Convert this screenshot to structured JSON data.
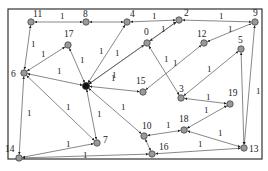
{
  "diagram": {
    "type": "directed weighted graph",
    "frame": {
      "x": 8,
      "y": 9,
      "w": 254,
      "h": 150,
      "stroke": "#333333"
    },
    "colors": {
      "node_fill": "#9a9a9a",
      "node_stroke": "#444444",
      "hub_fill": "#111111",
      "edge": "#555555"
    },
    "nodes": [
      {
        "id": "0",
        "label": "0",
        "x": 147,
        "y": 43,
        "lx": 144,
        "ly": 35
      },
      {
        "id": "1",
        "label": "",
        "x": 86,
        "y": 86,
        "hub": true
      },
      {
        "id": "2",
        "label": "2",
        "x": 179,
        "y": 20,
        "lx": 184,
        "ly": 16
      },
      {
        "id": "3",
        "label": "3",
        "x": 181,
        "y": 98,
        "lx": 179,
        "ly": 92
      },
      {
        "id": "4",
        "label": "4",
        "x": 127,
        "y": 22,
        "lx": 130,
        "ly": 17
      },
      {
        "id": "5",
        "label": "5",
        "x": 241,
        "y": 49,
        "lx": 238,
        "ly": 43
      },
      {
        "id": "6",
        "label": "6",
        "x": 24,
        "y": 73,
        "lx": 11,
        "ly": 77
      },
      {
        "id": "7",
        "label": "7",
        "x": 97,
        "y": 143,
        "lx": 103,
        "ly": 143
      },
      {
        "id": "8",
        "label": "8",
        "x": 86,
        "y": 22,
        "lx": 83,
        "ly": 17
      },
      {
        "id": "9",
        "label": "9",
        "x": 255,
        "y": 22,
        "lx": 253,
        "ly": 16
      },
      {
        "id": "10",
        "label": "10",
        "x": 144,
        "y": 136,
        "lx": 142,
        "ly": 129
      },
      {
        "id": "11",
        "label": "11",
        "x": 31,
        "y": 22,
        "lx": 33,
        "ly": 17
      },
      {
        "id": "12",
        "label": "12",
        "x": 204,
        "y": 43,
        "lx": 197,
        "ly": 37
      },
      {
        "id": "13",
        "label": "13",
        "x": 244,
        "y": 148,
        "lx": 249,
        "ly": 152
      },
      {
        "id": "14",
        "label": "14",
        "x": 19,
        "y": 158,
        "lx": 5,
        "ly": 152
      },
      {
        "id": "15",
        "label": "15",
        "x": 143,
        "y": 92,
        "lx": 136,
        "ly": 84
      },
      {
        "id": "16",
        "label": "16",
        "x": 152,
        "y": 154,
        "lx": 159,
        "ly": 150
      },
      {
        "id": "17",
        "label": "17",
        "x": 68,
        "y": 45,
        "lx": 64,
        "ly": 37
      },
      {
        "id": "18",
        "label": "18",
        "x": 184,
        "y": 130,
        "lx": 179,
        "ly": 122
      },
      {
        "id": "19",
        "label": "19",
        "x": 230,
        "y": 104,
        "lx": 228,
        "ly": 96
      }
    ],
    "edges": [
      {
        "from": "11",
        "to": "8",
        "w": "1",
        "lx": 60,
        "ly": 19
      },
      {
        "from": "4",
        "to": "8",
        "w": "",
        "lx": 0,
        "ly": 0
      },
      {
        "from": "11",
        "to": "6",
        "w": "1",
        "lx": 31,
        "ly": 47
      },
      {
        "from": "17",
        "to": "6",
        "w": "1",
        "lx": 41,
        "ly": 57
      },
      {
        "from": "6",
        "to": "1",
        "w": "1",
        "lx": 57,
        "ly": 74
      },
      {
        "from": "17",
        "to": "1",
        "w": "1",
        "lx": 80,
        "ly": 63
      },
      {
        "from": "4",
        "to": "1",
        "w": "1",
        "lx": 99,
        "ly": 54
      },
      {
        "from": "0",
        "to": "1",
        "w": "1",
        "lx": 115,
        "ly": 56
      },
      {
        "from": "2",
        "to": "1",
        "w": "1",
        "lx": 112,
        "ly": 78
      },
      {
        "from": "1",
        "to": "15",
        "w": "1",
        "lx": 111,
        "ly": 81
      },
      {
        "from": "6",
        "to": "7",
        "w": "1",
        "lx": 66,
        "ly": 110
      },
      {
        "from": "6",
        "to": "14",
        "w": "1",
        "lx": 27,
        "ly": 116
      },
      {
        "from": "7",
        "to": "1",
        "w": "1",
        "lx": 97,
        "ly": 117
      },
      {
        "from": "10",
        "to": "1",
        "w": "1",
        "lx": 121,
        "ly": 110
      },
      {
        "from": "7",
        "to": "14",
        "w": "1",
        "lx": 66,
        "ly": 147
      },
      {
        "from": "16",
        "to": "14",
        "w": "1",
        "lx": 83,
        "ly": 158
      },
      {
        "from": "0",
        "to": "2",
        "w": "1",
        "lx": 161,
        "ly": 32
      },
      {
        "from": "4",
        "to": "2",
        "w": "1",
        "lx": 152,
        "ly": 19
      },
      {
        "from": "2",
        "to": "9",
        "w": "1",
        "lx": 219,
        "ly": 19
      },
      {
        "from": "9",
        "to": "12",
        "w": "1",
        "lx": 228,
        "ly": 32
      },
      {
        "from": "0",
        "to": "3",
        "w": "1",
        "lx": 164,
        "ly": 62
      },
      {
        "from": "12",
        "to": "15",
        "w": "1",
        "lx": 173,
        "ly": 66
      },
      {
        "from": "5",
        "to": "3",
        "w": "1",
        "lx": 207,
        "ly": 72
      },
      {
        "from": "3",
        "to": "19",
        "w": "1",
        "lx": 206,
        "ly": 100
      },
      {
        "from": "19",
        "to": "18",
        "w": "1",
        "lx": 204,
        "ly": 113
      },
      {
        "from": "10",
        "to": "18",
        "w": "1",
        "lx": 166,
        "ly": 128
      },
      {
        "from": "18",
        "to": "13",
        "w": "1",
        "lx": 218,
        "ly": 136
      },
      {
        "from": "13",
        "to": "16",
        "w": "1",
        "lx": 198,
        "ly": 147
      },
      {
        "from": "13",
        "to": "5",
        "w": "",
        "lx": 0,
        "ly": 0
      },
      {
        "from": "13",
        "to": "9",
        "w": "1",
        "lx": 256,
        "ly": 94
      },
      {
        "from": "10",
        "to": "16",
        "w": "",
        "lx": 0,
        "ly": 0
      }
    ]
  }
}
